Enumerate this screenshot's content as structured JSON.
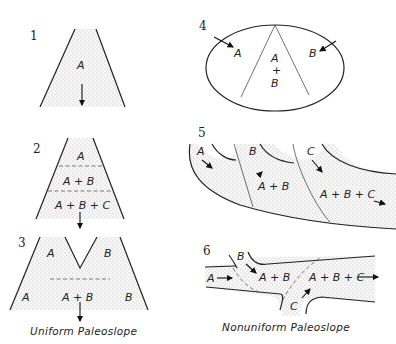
{
  "figure": {
    "panels": [
      {
        "number": "1",
        "labels": [
          "A"
        ],
        "group": "uniform"
      },
      {
        "number": "2",
        "labels": [
          "A",
          "A + B",
          "A + B + C"
        ],
        "group": "uniform"
      },
      {
        "number": "3",
        "labels": [
          "A",
          "B",
          "A",
          "A + B",
          "B"
        ],
        "group": "uniform"
      },
      {
        "number": "4",
        "labels": [
          "A",
          "B",
          "A",
          "+",
          "B"
        ],
        "group": "nonuniform"
      },
      {
        "number": "5",
        "labels": [
          "A",
          "B",
          "C",
          "A + B",
          "A + B + C"
        ],
        "group": "nonuniform"
      },
      {
        "number": "6",
        "labels": [
          "B",
          "A",
          "A + B",
          "A + B + C",
          "C"
        ],
        "group": "nonuniform"
      }
    ],
    "captions": {
      "left": "Uniform Paleoslope",
      "right": "Nonuniform Paleoslope"
    },
    "colors": {
      "ink": "#222222",
      "fill_stipple": "#f0f0f0",
      "background": "#ffffff"
    }
  }
}
